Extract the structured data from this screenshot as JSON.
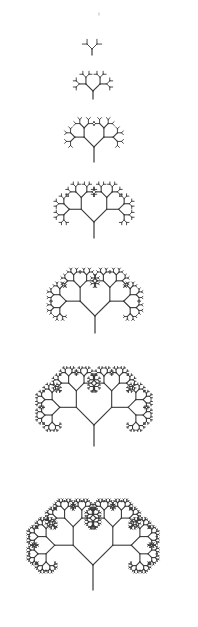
{
  "diagram": {
    "type": "fractal-binary-tree-sequence",
    "background": "#ffffff",
    "stroke_color": "#3a3a3a",
    "branch_angle_deg": 45,
    "length_ratio": 0.66,
    "faint_mark": {
      "x": 99,
      "y": 15,
      "length": 2,
      "color": "#bbbbbb"
    },
    "trees": [
      {
        "iteration": 1,
        "base_x": 92,
        "base_y": 55,
        "trunk": 6,
        "first_branch": 7,
        "depth": 2
      },
      {
        "iteration": 2,
        "base_x": 93,
        "base_y": 99,
        "trunk": 8,
        "first_branch": 10,
        "depth": 4
      },
      {
        "iteration": 3,
        "base_x": 94,
        "base_y": 162,
        "trunk": 15,
        "first_branch": 14,
        "depth": 5
      },
      {
        "iteration": 4,
        "base_x": 94,
        "base_y": 238,
        "trunk": 16,
        "first_branch": 18,
        "depth": 6
      },
      {
        "iteration": 5,
        "base_x": 95,
        "base_y": 333,
        "trunk": 17,
        "first_branch": 21,
        "depth": 7
      },
      {
        "iteration": 6,
        "base_x": 94,
        "base_y": 446,
        "trunk": 21,
        "first_branch": 25,
        "depth": 8
      },
      {
        "iteration": 7,
        "base_x": 93,
        "base_y": 590,
        "trunk": 25,
        "first_branch": 28,
        "depth": 9
      }
    ]
  }
}
